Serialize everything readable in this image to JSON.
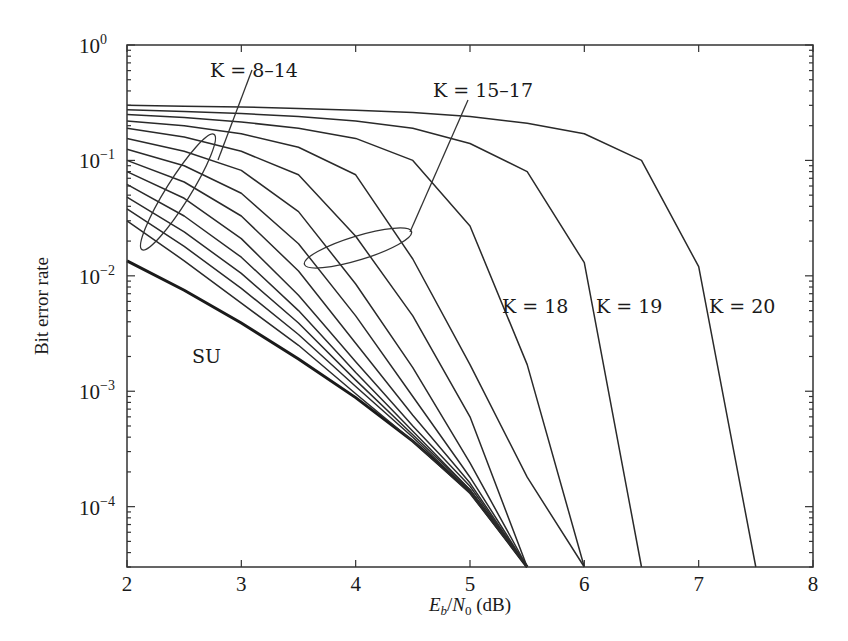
{
  "chart_data": {
    "type": "line",
    "title": "",
    "xlabel": "E_b/N_0 (dB)",
    "ylabel": "Bit error rate",
    "xlim": [
      2,
      8
    ],
    "ylim": [
      3e-05,
      1
    ],
    "yscale": "log",
    "grid": false,
    "x_ticks": [
      "2",
      "3",
      "4",
      "5",
      "6",
      "7",
      "8"
    ],
    "y_ticks": [
      "10^0",
      "10^-1",
      "10^-2",
      "10^-3",
      "10^-4"
    ],
    "x": [
      2,
      2.5,
      3,
      3.5,
      4,
      4.5,
      5,
      5.5,
      6,
      6.5,
      7,
      7.5
    ],
    "series": [
      {
        "name": "SU",
        "values": [
          0.0135,
          0.0075,
          0.0039,
          0.0019,
          0.00088,
          0.00037,
          0.000135,
          3e-05,
          null,
          null,
          null,
          null
        ]
      },
      {
        "name": "K=8",
        "values": [
          0.03,
          0.0135,
          0.0058,
          0.0025,
          0.00095,
          0.00037,
          0.00013,
          3e-05,
          null,
          null,
          null,
          null
        ]
      },
      {
        "name": "K=9",
        "values": [
          0.038,
          0.018,
          0.0078,
          0.0031,
          0.0011,
          0.0004,
          0.000135,
          3e-05,
          null,
          null,
          null,
          null
        ]
      },
      {
        "name": "K=10",
        "values": [
          0.048,
          0.024,
          0.0105,
          0.0039,
          0.00125,
          0.00042,
          0.00014,
          3e-05,
          null,
          null,
          null,
          null
        ]
      },
      {
        "name": "K=11",
        "values": [
          0.062,
          0.033,
          0.0145,
          0.005,
          0.00145,
          0.00045,
          0.00014,
          3e-05,
          null,
          null,
          null,
          null
        ]
      },
      {
        "name": "K=12",
        "values": [
          0.08,
          0.047,
          0.021,
          0.0068,
          0.0018,
          0.0005,
          0.00015,
          3e-05,
          null,
          null,
          null,
          null
        ]
      },
      {
        "name": "K=13",
        "values": [
          0.1,
          0.065,
          0.033,
          0.011,
          0.0026,
          0.00062,
          0.00016,
          3e-05,
          null,
          null,
          null,
          null
        ]
      },
      {
        "name": "K=14",
        "values": [
          0.125,
          0.09,
          0.052,
          0.019,
          0.0045,
          0.0009,
          0.00018,
          3e-05,
          null,
          null,
          null,
          null
        ]
      },
      {
        "name": "K=15",
        "values": [
          0.155,
          0.12,
          0.082,
          0.036,
          0.0085,
          0.0016,
          0.00024,
          3e-05,
          null,
          null,
          null,
          null
        ]
      },
      {
        "name": "K=16",
        "values": [
          0.19,
          0.16,
          0.12,
          0.075,
          0.022,
          0.0045,
          0.0006,
          3e-05,
          null,
          null,
          null,
          null
        ]
      },
      {
        "name": "K=17",
        "values": [
          0.22,
          0.2,
          0.17,
          0.13,
          0.075,
          0.014,
          0.0017,
          0.00018,
          3e-05,
          null,
          null,
          null
        ]
      },
      {
        "name": "K=18",
        "values": [
          0.25,
          0.235,
          0.215,
          0.19,
          0.155,
          0.1,
          0.027,
          0.0017,
          3e-05,
          null,
          null,
          null
        ]
      },
      {
        "name": "K=19",
        "values": [
          0.275,
          0.265,
          0.255,
          0.24,
          0.22,
          0.19,
          0.14,
          0.08,
          0.013,
          3e-05,
          null,
          null
        ]
      },
      {
        "name": "K=20",
        "values": [
          0.3,
          0.295,
          0.29,
          0.282,
          0.272,
          0.26,
          0.24,
          0.21,
          0.17,
          0.1,
          0.012,
          3e-05
        ]
      }
    ],
    "annotations": [
      {
        "text": "K = 8–14",
        "target": "curves K=8..14 near x=2.4"
      },
      {
        "text": "K = 15–17",
        "target": "curves K=15..17 near x=4.0"
      },
      {
        "text": "K = 18",
        "target": "curve K=18"
      },
      {
        "text": "K = 19",
        "target": "curve K=19"
      },
      {
        "text": "K = 20",
        "target": "curve K=20"
      },
      {
        "text": "SU",
        "target": "single-user bound (bold)"
      }
    ]
  },
  "labels": {
    "ylabel": "Bit error rate",
    "xlabel_E": "E",
    "xlabel_b": "b",
    "xlabel_slash": "/",
    "xlabel_N": "N",
    "xlabel_0": "0",
    "xlabel_unit": " (dB)",
    "annot_k8_14": "K = 8–14",
    "annot_k15_17": "K = 15–17",
    "annot_k18": "K = 18",
    "annot_k19": "K = 19",
    "annot_k20": "K = 20",
    "annot_su": "SU"
  }
}
